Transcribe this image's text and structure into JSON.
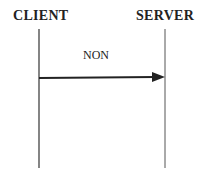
{
  "diagram": {
    "type": "sequence-diagram",
    "lifelines": [
      {
        "label": "CLIENT",
        "x": 39
      },
      {
        "label": "SERVER",
        "x": 165
      }
    ],
    "messages": [
      {
        "label": "NON",
        "from": "CLIENT",
        "to": "SERVER",
        "y": 78
      }
    ],
    "colors": {
      "line": "#333333",
      "text": "#222222",
      "background": "#ffffff"
    }
  }
}
